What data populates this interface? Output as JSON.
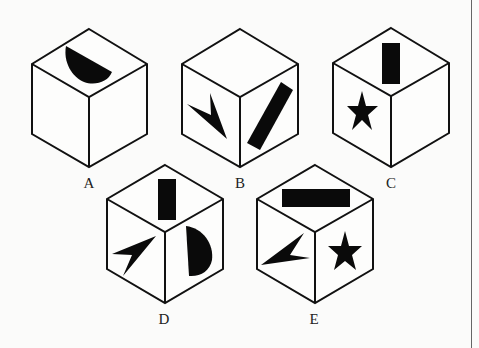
{
  "figure": {
    "cubes": [
      {
        "label": "A",
        "faces": {
          "top": "half-circle",
          "left": "blank",
          "right": "blank"
        }
      },
      {
        "label": "B",
        "faces": {
          "top": "blank",
          "left": "arrowhead",
          "right": "bar"
        }
      },
      {
        "label": "C",
        "faces": {
          "top": "bar",
          "left": "star",
          "right": "blank"
        }
      },
      {
        "label": "D",
        "faces": {
          "top": "bar",
          "left": "arrowhead",
          "right": "half-circle"
        }
      },
      {
        "label": "E",
        "faces": {
          "top": "bar",
          "left": "arrowhead",
          "right": "star"
        }
      }
    ]
  },
  "colors": {
    "background": "#fbfbfa",
    "stroke": "#111111",
    "fill": "#0a0a0a"
  }
}
